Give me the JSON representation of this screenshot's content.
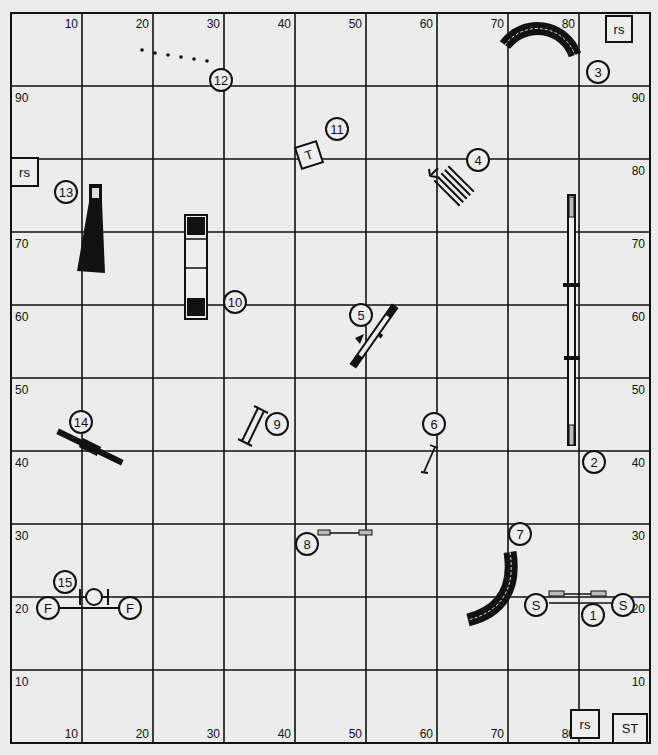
{
  "course": {
    "grid": {
      "left": 11,
      "top": 13,
      "cell": 71,
      "cellY": 73,
      "cols": 9,
      "rows": 10,
      "line_color": "#111111",
      "background": "#ececec"
    },
    "axis_labels": {
      "top": [
        "10",
        "20",
        "30",
        "40",
        "50",
        "60",
        "70",
        "80"
      ],
      "bottom": [
        "10",
        "20",
        "30",
        "40",
        "50",
        "60",
        "70",
        "80"
      ],
      "left": [
        "90",
        "80",
        "70",
        "60",
        "50",
        "40",
        "30",
        "20",
        "10"
      ],
      "right": [
        "90",
        "80",
        "70",
        "60",
        "50",
        "40",
        "30",
        "20",
        "10"
      ]
    },
    "boxes": [
      {
        "id": "rs-top-right",
        "label": "rs",
        "x": 606,
        "y": 16,
        "w": 26,
        "h": 26,
        "rot": 0
      },
      {
        "id": "rs-left",
        "label": "rs",
        "x": 11,
        "y": 158,
        "w": 27,
        "h": 28,
        "rot": 0
      },
      {
        "id": "rs-bottom",
        "label": "rs",
        "x": 571,
        "y": 710,
        "w": 28,
        "h": 28,
        "rot": 0
      },
      {
        "id": "st-start",
        "label": "ST",
        "x": 613,
        "y": 714,
        "w": 34,
        "h": 29,
        "rot": 0
      },
      {
        "id": "t-table",
        "label": "T",
        "x": 298,
        "y": 144,
        "w": 22,
        "h": 22,
        "rot": -18
      }
    ],
    "numbers": [
      {
        "n": "1",
        "x": 593,
        "y": 615
      },
      {
        "n": "2",
        "x": 594,
        "y": 462
      },
      {
        "n": "3",
        "x": 598,
        "y": 72
      },
      {
        "n": "4",
        "x": 478,
        "y": 160
      },
      {
        "n": "5",
        "x": 361,
        "y": 315
      },
      {
        "n": "6",
        "x": 434,
        "y": 424
      },
      {
        "n": "7",
        "x": 520,
        "y": 534
      },
      {
        "n": "8",
        "x": 307,
        "y": 544
      },
      {
        "n": "9",
        "x": 277,
        "y": 424
      },
      {
        "n": "10",
        "x": 235,
        "y": 302
      },
      {
        "n": "11",
        "x": 337,
        "y": 129
      },
      {
        "n": "12",
        "x": 221,
        "y": 80
      },
      {
        "n": "13",
        "x": 66,
        "y": 192
      },
      {
        "n": "14",
        "x": 81,
        "y": 422
      },
      {
        "n": "15",
        "x": 65,
        "y": 582
      }
    ],
    "markers": [
      {
        "label": "S",
        "x": 536,
        "y": 605
      },
      {
        "label": "S",
        "x": 623,
        "y": 605
      },
      {
        "label": "F",
        "x": 48,
        "y": 608
      },
      {
        "label": "F",
        "x": 130,
        "y": 608
      }
    ],
    "obstacles": {
      "tunnel_curved_top": {
        "number": "3",
        "type": "curved-tunnel"
      },
      "tunnel_curved_bottom": {
        "number": "7",
        "type": "curved-tunnel"
      },
      "dogwalk": {
        "number": "2",
        "type": "dog-walk"
      },
      "aframe": {
        "number": "10",
        "type": "a-frame"
      },
      "chute": {
        "number": "13",
        "type": "collapsed-tunnel"
      },
      "teeter": {
        "number": "14",
        "type": "seesaw"
      },
      "weave": {
        "number": "12",
        "type": "weave-poles"
      },
      "tire": {
        "number": "15",
        "type": "tire-jump"
      },
      "broad": {
        "number": "4",
        "type": "broad-jump"
      },
      "seesaw5": {
        "number": "5",
        "type": "jump-with-wing"
      },
      "jump6": {
        "number": "6",
        "type": "single-bar-jump"
      },
      "jump8": {
        "number": "8",
        "type": "bar-jump"
      },
      "jump9": {
        "number": "9",
        "type": "panel-jump"
      },
      "jump1": {
        "number": "1",
        "type": "double-jump"
      }
    }
  }
}
